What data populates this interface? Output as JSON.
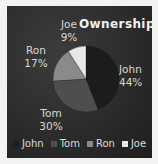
{
  "chart": {
    "title": "Ownership"
  },
  "chart_data": {
    "type": "pie",
    "title": "Ownership",
    "categories": [
      "John",
      "Tom",
      "Ron",
      "Joe"
    ],
    "values": [
      44,
      30,
      17,
      9
    ],
    "value_suffix": "%",
    "slice_labels": [
      {
        "name": "John",
        "pct": "44%"
      },
      {
        "name": "Tom",
        "pct": "30%"
      },
      {
        "name": "Ron",
        "pct": "17%"
      },
      {
        "name": "Joe",
        "pct": "9%"
      }
    ],
    "colors": [
      "#1c1c1c",
      "#4e4e4e",
      "#8a8a8a",
      "#e8e8e6"
    ],
    "legend": {
      "position": "bottom",
      "entries": [
        {
          "label": "John",
          "color": "#1c1c1c"
        },
        {
          "label": "Tom",
          "color": "#4e4e4e"
        },
        {
          "label": "Ron",
          "color": "#8a8a8a"
        },
        {
          "label": "Joe",
          "color": "#e8e8e6"
        }
      ]
    },
    "background_color": "#2b2b2b",
    "text_color": "#d8d8d8",
    "grid": false
  }
}
